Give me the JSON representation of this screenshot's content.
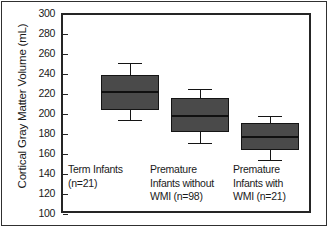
{
  "chart_data": {
    "type": "box",
    "title": "",
    "xlabel": "",
    "ylabel": "Cortical Gray Matter Volume (mL)",
    "ylim": [
      100,
      300
    ],
    "yticks": [
      300,
      280,
      260,
      240,
      220,
      200,
      180,
      160,
      140,
      120,
      100
    ],
    "ytick_labels": [
      "300",
      "280",
      "260",
      "240",
      "220",
      "200",
      "180",
      "160",
      "140",
      "120",
      "100"
    ],
    "grid": false,
    "legend": "none",
    "box_fill_color": "#4a4a4a",
    "box_edge_color": "#141414",
    "categories": [
      "Term Infants (n=21)",
      "Premature Infants without WMI (n=98)",
      "Premature Infants with WMI (n=21)"
    ],
    "boxes": [
      {
        "name": "Term Infants",
        "n": 21,
        "whisker_high": 252,
        "q3": 240,
        "median": 224,
        "q1": 205,
        "whisker_low": 195
      },
      {
        "name": "Premature Infants without WMI",
        "n": 98,
        "whisker_high": 226,
        "q3": 217,
        "median": 200,
        "q1": 183,
        "whisker_low": 172
      },
      {
        "name": "Premature Infants with WMI",
        "n": 21,
        "whisker_high": 199,
        "q3": 192,
        "median": 179,
        "q1": 165,
        "whisker_low": 155
      }
    ]
  },
  "axis": {
    "y_title": "Cortical Gray Matter Volume (mL)"
  },
  "category_labels": [
    {
      "line1": "Term Infants",
      "line2": "(n=21)",
      "line3": ""
    },
    {
      "line1": "Premature",
      "line2": "Infants without",
      "line3": "WMI (n=98)"
    },
    {
      "line1": "Premature",
      "line2": "Infants with",
      "line3": "WMI (n=21)"
    }
  ]
}
